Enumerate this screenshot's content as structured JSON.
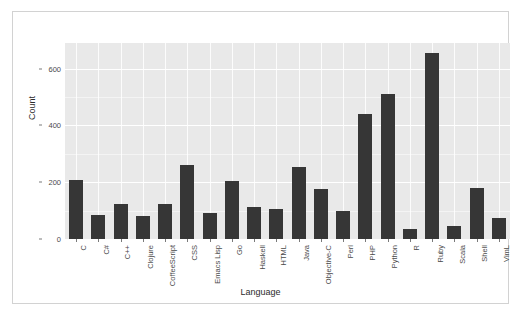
{
  "figure": {
    "top_cut_text": "",
    "background_color": "#ffffff",
    "border_color": "#d2d2d2",
    "panel_color": "#e9e9e9",
    "gridline_color": "#ffffff",
    "bar_color": "#363636"
  },
  "chart_data": {
    "type": "bar",
    "title": "",
    "xlabel": "Language",
    "ylabel": "Count",
    "categories": [
      "C",
      "C#",
      "C++",
      "Clojure",
      "CoffeeScript",
      "CSS",
      "Emacs Lisp",
      "Go",
      "Haskell",
      "HTML",
      "Java",
      "Objective-C",
      "Perl",
      "PHP",
      "Python",
      "R",
      "Ruby",
      "Scala",
      "Shell",
      "VimL"
    ],
    "values": [
      207,
      85,
      122,
      82,
      125,
      262,
      92,
      205,
      112,
      105,
      252,
      175,
      100,
      440,
      510,
      35,
      655,
      45,
      180,
      75
    ],
    "ylim": [
      0,
      690
    ],
    "yticks": [
      0,
      200,
      400,
      600
    ],
    "ytick_labels": [
      "0",
      "200",
      "400",
      "600"
    ],
    "minor_yticks": [
      100,
      300,
      500
    ],
    "grid": true,
    "legend": null
  }
}
